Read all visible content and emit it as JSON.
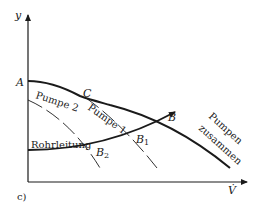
{
  "figure": {
    "panel_label": "c)",
    "axes": {
      "y_label": "y",
      "x_label": "V̇"
    },
    "points": {
      "A": "A",
      "B": "B",
      "B1": "B",
      "B1_sub": "1",
      "B2": "B",
      "B2_sub": "2",
      "C": "C"
    },
    "curves": {
      "pump1": "Pumpe 1",
      "pump2": "Pumpe 2",
      "pipe": "Rohrleitung",
      "combined_line1": "Pumpen",
      "combined_line2": "zusammen"
    },
    "colors": {
      "ink": "#1a1a1a",
      "background": "#ffffff"
    }
  }
}
